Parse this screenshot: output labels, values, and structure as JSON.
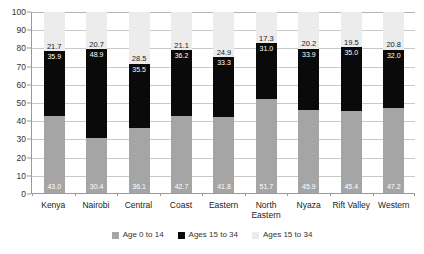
{
  "chart_data": {
    "type": "bar",
    "stacked": true,
    "title": "",
    "xlabel": "",
    "ylabel": "",
    "ylim": [
      0,
      100
    ],
    "yticks": [
      0,
      10,
      20,
      30,
      40,
      50,
      60,
      70,
      80,
      90,
      100
    ],
    "grid": true,
    "legend_position": "bottom",
    "categories": [
      "Kenya",
      "Nairobi",
      "Central",
      "Coast",
      "Eastern",
      "North Eastern",
      "Nyaza",
      "Rift Valley",
      "Western"
    ],
    "series": [
      {
        "name": "Age 0 to 14",
        "color": "#a5a5a5",
        "values": [
          43.0,
          30.4,
          36.1,
          42.7,
          41.8,
          51.7,
          45.9,
          45.4,
          47.2
        ]
      },
      {
        "name": "Ages 15 to 34",
        "color": "#0a0a0a",
        "values": [
          35.9,
          48.9,
          35.5,
          36.2,
          33.3,
          31.0,
          33.9,
          35.0,
          32.0
        ]
      },
      {
        "name": "Ages 15 to 34",
        "color": "#ececec",
        "values": [
          21.7,
          20.7,
          28.5,
          21.1,
          24.9,
          17.3,
          20.2,
          19.5,
          20.8
        ]
      }
    ],
    "bar_labels": {
      "top": [
        "21.7",
        "20.7",
        "28.5",
        "21.1",
        "24.9",
        "17.3",
        "20.2",
        "19.5",
        "20.8"
      ],
      "middle": [
        "35.9",
        "48.9",
        "35.5",
        "36.2",
        "33.3",
        "31.0",
        "33.9",
        "35.0",
        "32.0"
      ],
      "bottom": [
        "43.0",
        "30.4",
        "36.1",
        "42.7",
        "41.8",
        "51.7",
        "45.9",
        "45.4",
        "47.2"
      ]
    },
    "ytick_labels": [
      "100",
      "90",
      "80",
      "70",
      "60",
      "50",
      "40",
      "30",
      "20",
      "10",
      "0"
    ]
  },
  "legend": {
    "items": [
      {
        "label": "Age 0 to 14",
        "color": "#a5a5a5"
      },
      {
        "label": "Ages 15 to 34",
        "color": "#0a0a0a"
      },
      {
        "label": "Ages 15 to 34",
        "color": "#ececec"
      }
    ]
  },
  "category_lines": [
    [
      "Kenya",
      ""
    ],
    [
      "Nairobi",
      ""
    ],
    [
      "Central",
      ""
    ],
    [
      "Coast",
      ""
    ],
    [
      "Eastern",
      ""
    ],
    [
      "North",
      "Eastern"
    ],
    [
      "Nyaza",
      ""
    ],
    [
      "Rift Valley",
      ""
    ],
    [
      "Western",
      ""
    ]
  ]
}
